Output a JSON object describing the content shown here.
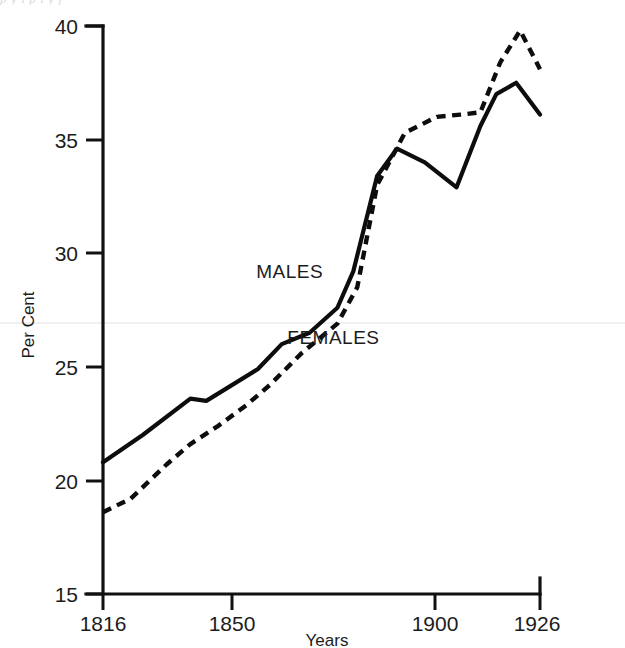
{
  "figure": {
    "top_bleed_text": "p  y  i  p  i  y  f",
    "background_color": "#ffffff",
    "ink_color": "#0d0d0d"
  },
  "chart_data": {
    "type": "line",
    "title": "",
    "subtitle": "",
    "xlabel": "Years",
    "ylabel": "Per Cent",
    "xlim": [
      1816,
      1926
    ],
    "ylim": [
      15,
      40
    ],
    "grid": false,
    "legend": "inline-annotations",
    "x_ticks": [
      1816,
      1850,
      1900,
      1926
    ],
    "x_tick_labels": [
      "1816",
      "1850",
      "1900",
      "1926"
    ],
    "y_ticks": [
      15,
      20,
      25,
      30,
      35,
      40
    ],
    "y_tick_labels": [
      "15",
      "20",
      "25",
      "30",
      "35",
      "40"
    ],
    "annotations": [
      {
        "text": "MALES",
        "x": 1863,
        "y": 28.9
      },
      {
        "text": "FEMALES",
        "x": 1874,
        "y": 26.0
      }
    ],
    "series": [
      {
        "name": "MALES",
        "style": "solid",
        "label": "MALES",
        "x": [
          1816,
          1826,
          1838,
          1842,
          1855,
          1861,
          1868,
          1875,
          1879,
          1885,
          1890,
          1897,
          1905,
          1911,
          1915,
          1920,
          1926
        ],
        "values": [
          20.8,
          22.0,
          23.6,
          23.5,
          24.9,
          26.0,
          26.5,
          27.6,
          29.2,
          33.4,
          34.6,
          34.0,
          32.9,
          35.6,
          37.0,
          37.5,
          36.1
        ]
      },
      {
        "name": "FEMALES",
        "style": "dashed",
        "label": "FEMALES",
        "x": [
          1816,
          1823,
          1832,
          1838,
          1845,
          1852,
          1858,
          1866,
          1875,
          1880,
          1885,
          1892,
          1900,
          1906,
          1911,
          1916,
          1921,
          1926
        ],
        "values": [
          18.6,
          19.2,
          20.7,
          21.6,
          22.4,
          23.3,
          24.2,
          25.6,
          26.9,
          28.5,
          33.0,
          35.3,
          36.0,
          36.1,
          36.2,
          38.4,
          39.8,
          38.1
        ]
      }
    ]
  }
}
